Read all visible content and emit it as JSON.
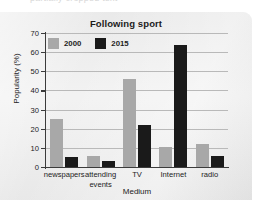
{
  "ghost_text": "partially cropped text",
  "chart_data": {
    "type": "bar",
    "title": "Following sport",
    "xlabel": "Medium",
    "ylabel": "Popularity (%)",
    "ylim": [
      0,
      70
    ],
    "yticks": [
      0,
      10,
      20,
      30,
      40,
      50,
      60,
      70
    ],
    "ytick_labels": [
      "0",
      "10",
      "20",
      "30",
      "40",
      "50",
      "60",
      "70"
    ],
    "grid": true,
    "legend_position": "top-left",
    "categories": [
      "newspapers",
      "attending events",
      "TV",
      "Internet",
      "radio"
    ],
    "category_lines": [
      [
        "newspapers"
      ],
      [
        "attending",
        "events"
      ],
      [
        "TV"
      ],
      [
        "Internet"
      ],
      [
        "radio"
      ]
    ],
    "series": [
      {
        "name": "2000",
        "color": "#a8a8a8",
        "values": [
          25,
          6,
          46,
          10.5,
          12
        ]
      },
      {
        "name": "2015",
        "color": "#1a1a1a",
        "values": [
          5,
          3,
          22,
          64,
          6
        ]
      }
    ]
  }
}
